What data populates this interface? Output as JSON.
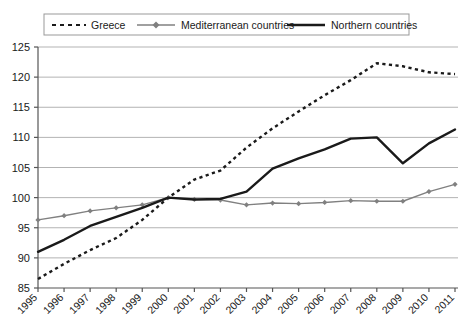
{
  "chart_data": {
    "type": "line",
    "title": "",
    "subtitle": "",
    "xlabel": "",
    "ylabel": "",
    "x": [
      1995,
      1996,
      1997,
      1998,
      1999,
      2000,
      2001,
      2002,
      2003,
      2004,
      2005,
      2006,
      2007,
      2008,
      2009,
      2010,
      2011
    ],
    "xtick_labels": [
      "1995",
      "1996",
      "1997",
      "1998",
      "1999",
      "2000",
      "2001",
      "2002",
      "2003",
      "2004",
      "2005",
      "2006",
      "2007",
      "2008",
      "2009",
      "2010",
      "2011"
    ],
    "ytick_labels": [
      "85",
      "90",
      "95",
      "100",
      "105",
      "110",
      "115",
      "120",
      "125"
    ],
    "yticks": [
      85,
      90,
      95,
      100,
      105,
      110,
      115,
      120,
      125
    ],
    "ylim": [
      85,
      125
    ],
    "xlim": [
      1995,
      2011
    ],
    "grid": true,
    "grid_axis": "y",
    "legend_position": "top",
    "series": [
      {
        "name": "Greece",
        "style": "dotted",
        "color": "#1a1a1a",
        "marker": "none",
        "values": [
          86.5,
          89.0,
          91.3,
          93.3,
          96.3,
          100.0,
          103.0,
          104.5,
          108.3,
          111.5,
          114.3,
          117.0,
          119.5,
          122.3,
          121.8,
          120.8,
          120.5
        ]
      },
      {
        "name": "Mediterranean countries",
        "style": "solid-marker",
        "color": "#808080",
        "marker": "diamond",
        "values": [
          96.3,
          97.0,
          97.8,
          98.3,
          98.8,
          100.0,
          99.7,
          99.6,
          98.8,
          99.1,
          99.0,
          99.2,
          99.5,
          99.4,
          99.4,
          101.0,
          102.2
        ]
      },
      {
        "name": "Northern countries",
        "style": "solid-thick",
        "color": "#1a1a1a",
        "marker": "none",
        "values": [
          91.0,
          93.0,
          95.3,
          96.8,
          98.3,
          100.0,
          99.7,
          99.8,
          101.0,
          104.8,
          106.5,
          108.0,
          109.8,
          110.0,
          105.7,
          109.0,
          111.3
        ]
      }
    ]
  },
  "legend": {
    "items": [
      {
        "label": "Greece",
        "swatch": "dotted-line-swatch"
      },
      {
        "label": "Mediterranean countries",
        "swatch": "marker-line-swatch"
      },
      {
        "label": "Northern countries",
        "swatch": "thick-line-swatch"
      }
    ]
  },
  "colors": {
    "greece": "#1a1a1a",
    "mediterranean": "#808080",
    "northern": "#1a1a1a",
    "grid": "#b3b3b3",
    "axis": "#555555",
    "legend_border": "#999999",
    "background": "#ffffff"
  }
}
